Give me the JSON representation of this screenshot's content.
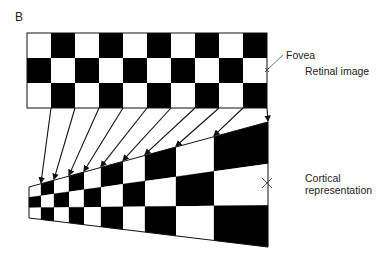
{
  "panel_label": "B",
  "labels": {
    "fovea": "Fovea",
    "retinal": "Retinal image",
    "cortical_line1": "Cortical",
    "cortical_line2": "representation"
  },
  "colors": {
    "dark": "#000000",
    "light": "#ffffff",
    "line": "#111111"
  },
  "retinal_grid": {
    "x": 27,
    "y": 33,
    "cols": 10,
    "rows": 3,
    "cell_w": 24,
    "cell_h": 25,
    "first_cell": "white"
  },
  "cortical_grid": {
    "col_edges": [
      29,
      41,
      54,
      69,
      84,
      101,
      123,
      145,
      176,
      214,
      268
    ],
    "left_top": 187,
    "left_bottom": 218,
    "right_top": 122,
    "right_bottom": 247
  },
  "fovea_marker": {
    "retinal": [
      267,
      70
    ],
    "cortical": [
      267,
      183
    ]
  }
}
